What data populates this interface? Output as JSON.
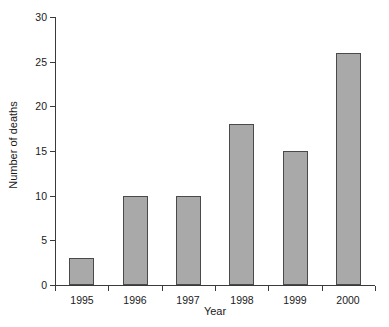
{
  "chart_data": {
    "type": "bar",
    "title": "",
    "subtitle": "",
    "xlabel": "Year",
    "ylabel": "Number of deaths",
    "categories": [
      "1995",
      "1996",
      "1997",
      "1998",
      "1999",
      "2000"
    ],
    "values": [
      3,
      10,
      10,
      18,
      15,
      26
    ],
    "series": [
      {
        "name": "Number of deaths",
        "values": [
          3,
          10,
          10,
          18,
          15,
          26
        ]
      }
    ],
    "ylim": [
      0,
      30
    ],
    "yticks": [
      0,
      5,
      10,
      15,
      20,
      25,
      30
    ],
    "ytick_labels": [
      "0",
      "5",
      "10",
      "15",
      "20",
      "25",
      "30"
    ],
    "grid": false,
    "legend": false,
    "legend_position": "none",
    "annotations": [],
    "bar_fill_color": "#a9a9a9",
    "bar_edge_color": "#4a4a4a",
    "axis_color": "#3a3a3a",
    "background_color": "#ffffff",
    "text_color": "#1a1a1a"
  }
}
